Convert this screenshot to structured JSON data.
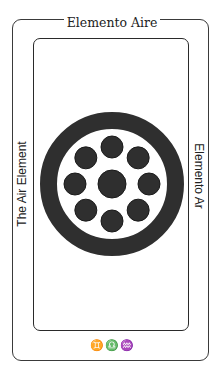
{
  "card": {
    "title_top": "Elemento Aire",
    "title_left": "The Air Element",
    "title_right": "Elemento Ar",
    "symbols": "♊♎♒",
    "symbol_names": [
      "gemini-icon",
      "libra-icon",
      "aquarius-icon"
    ]
  },
  "emblem": {
    "center": [
      112,
      184
    ],
    "outer_radius": 72,
    "ring_thickness": 17,
    "inner_dot_radius": 14,
    "outer_dot_radius": 11,
    "outer_dot_orbit": 37,
    "outer_dot_count": 8,
    "ink_color": "#2f2f2f"
  }
}
